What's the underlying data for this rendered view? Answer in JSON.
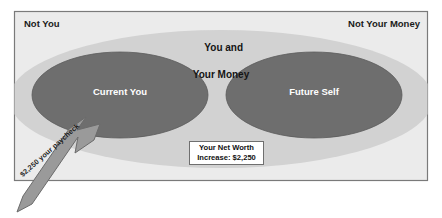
{
  "diagram": {
    "title_implied": "You and Your Money venn diagram",
    "outer_box": {
      "background_color": "#ebebeb",
      "border_color": "#7a7a7a"
    },
    "regions": {
      "outside_left_label": "Not You",
      "outside_right_label": "Not Your Money",
      "outer_ellipse": {
        "label_line1": "You and",
        "label_line2": "Your Money",
        "fill_color": "#d2d2d2"
      },
      "left_ellipse": {
        "label": "Current You",
        "fill_color": "#6e6e6e",
        "text_color": "#ffffff"
      },
      "right_ellipse": {
        "label": "Future Self",
        "fill_color": "#6e6e6e",
        "text_color": "#ffffff"
      }
    },
    "callout": {
      "line1": "Your Net Worth",
      "line2": "Increase: $2,250",
      "background_color": "#ffffff",
      "border_color": "#6f6f6f"
    },
    "arrow": {
      "label": "$2,250 your paycheck",
      "fill_color": "#9a9a9a",
      "stroke_color": "#6b6b6b",
      "points_to": "Current You"
    }
  }
}
